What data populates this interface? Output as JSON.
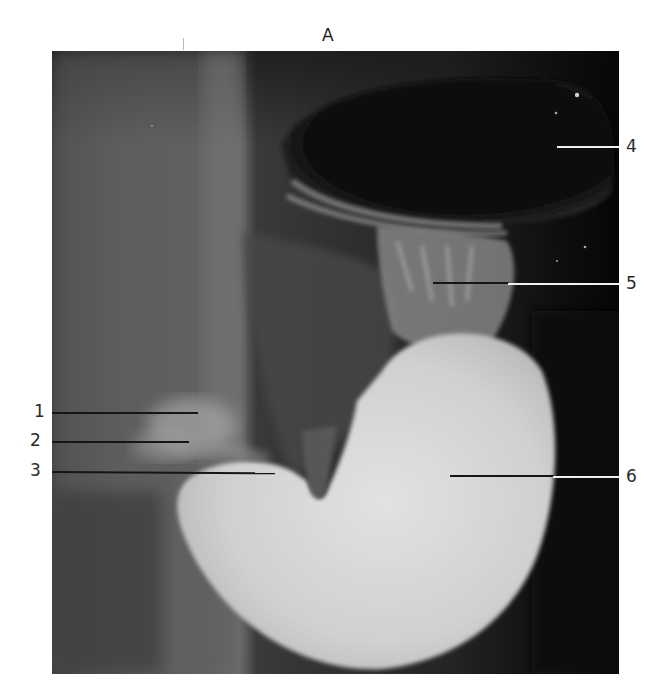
{
  "figure": {
    "panel_label": "A",
    "image_type": "radiograph",
    "colors": {
      "background": "#ffffff",
      "gas_dark": "#0b0b0b",
      "soft_tissue": "#5a5a5a",
      "barium_bright": "#d8d8d8",
      "leader_dark": "#151515",
      "leader_light": "#f0f0f0"
    }
  },
  "labels": [
    {
      "number": "1",
      "side": "left"
    },
    {
      "number": "2",
      "side": "left"
    },
    {
      "number": "3",
      "side": "left"
    },
    {
      "number": "4",
      "side": "right"
    },
    {
      "number": "5",
      "side": "right"
    },
    {
      "number": "6",
      "side": "right"
    }
  ]
}
